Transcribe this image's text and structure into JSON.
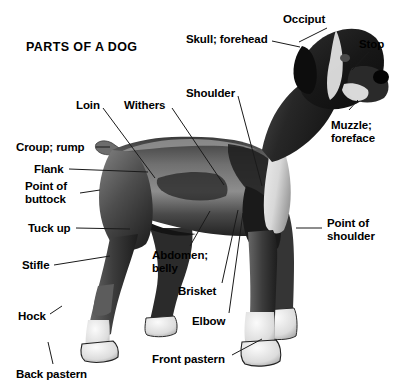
{
  "title": "PARTS OF A DOG",
  "subject": {
    "animal": "dog",
    "breed_appearance": "boxer",
    "orientation": "left profile, facing right",
    "rendering": "black and white photograph"
  },
  "colors": {
    "background": "#ffffff",
    "text": "#000000",
    "leader_line": "#1a1a1a",
    "coat_dark": "#1c1c1c",
    "coat_mid": "#6f6f6f",
    "coat_light": "#c9c9c9",
    "coat_white": "#f2f2f2"
  },
  "labels": [
    {
      "id": "occiput",
      "text": "Occiput",
      "lines": [
        "Occiput"
      ],
      "x": 283,
      "y": 13,
      "align": "left",
      "line": [
        327,
        28,
        299,
        42
      ]
    },
    {
      "id": "skull-forehead",
      "text": "Skull; forehead",
      "lines": [
        "Skull; forehead"
      ],
      "x": 186,
      "y": 33,
      "align": "left",
      "line": [
        272,
        41,
        300,
        47
      ]
    },
    {
      "id": "stop",
      "text": "Stop",
      "lines": [
        "Stop"
      ],
      "x": 359,
      "y": 38,
      "align": "left",
      "line": [
        369,
        52,
        352,
        70
      ]
    },
    {
      "id": "shoulder",
      "text": "Shoulder",
      "lines": [
        "Shoulder"
      ],
      "x": 186,
      "y": 87,
      "align": "left",
      "line": [
        238,
        96,
        262,
        186
      ]
    },
    {
      "id": "loin",
      "text": "Loin",
      "lines": [
        "Loin"
      ],
      "x": 76,
      "y": 99,
      "align": "left",
      "line": [
        103,
        108,
        155,
        178
      ]
    },
    {
      "id": "withers",
      "text": "Withers",
      "lines": [
        "Withers"
      ],
      "x": 124,
      "y": 99,
      "align": "left",
      "line": [
        172,
        108,
        224,
        185
      ]
    },
    {
      "id": "muzzle-foreface",
      "text": "Muzzle; foreface",
      "lines": [
        "Muzzle;",
        "foreface"
      ],
      "x": 331,
      "y": 119,
      "align": "left",
      "line": [
        349,
        110,
        358,
        100
      ]
    },
    {
      "id": "croup-rump",
      "text": "Croup; rump",
      "lines": [
        "Croup; rump"
      ],
      "x": 16,
      "y": 141,
      "align": "left",
      "line": [
        96,
        147,
        110,
        147
      ]
    },
    {
      "id": "flank",
      "text": "Flank",
      "lines": [
        "Flank"
      ],
      "x": 34,
      "y": 163,
      "align": "left",
      "line": [
        69,
        169,
        148,
        172
      ]
    },
    {
      "id": "point-of-buttock",
      "text": "Point of buttock",
      "lines": [
        "Point of",
        "buttock"
      ],
      "x": 25,
      "y": 180,
      "align": "left",
      "line": [
        80,
        193,
        100,
        190
      ]
    },
    {
      "id": "point-of-shoulder",
      "text": "Point of shoulder",
      "lines": [
        "Point of",
        "shoulder"
      ],
      "x": 327,
      "y": 217,
      "align": "left",
      "line": [
        322,
        228,
        296,
        228
      ]
    },
    {
      "id": "tuck-up",
      "text": "Tuck up",
      "lines": [
        "Tuck up"
      ],
      "x": 28,
      "y": 222,
      "align": "left",
      "line": [
        76,
        228,
        130,
        229
      ]
    },
    {
      "id": "abdomen-belly",
      "text": "Abdomen; belly",
      "lines": [
        "Abdomen;",
        "belly"
      ],
      "x": 152,
      "y": 249,
      "align": "left",
      "line": [
        190,
        246,
        210,
        211
      ]
    },
    {
      "id": "stifle",
      "text": "Stifle",
      "lines": [
        "Stifle"
      ],
      "x": 22,
      "y": 259,
      "align": "left",
      "line": [
        54,
        265,
        110,
        256
      ]
    },
    {
      "id": "brisket",
      "text": "Brisket",
      "lines": [
        "Brisket"
      ],
      "x": 178,
      "y": 285,
      "align": "left",
      "line": [
        222,
        283,
        238,
        210
      ]
    },
    {
      "id": "hock",
      "text": "Hock",
      "lines": [
        "Hock"
      ],
      "x": 18,
      "y": 310,
      "align": "left",
      "line": [
        50,
        314,
        62,
        306
      ]
    },
    {
      "id": "elbow",
      "text": "Elbow",
      "lines": [
        "Elbow"
      ],
      "x": 192,
      "y": 315,
      "align": "left",
      "line": [
        229,
        313,
        243,
        213
      ]
    },
    {
      "id": "front-pastern",
      "text": "Front pastern",
      "lines": [
        "Front pastern"
      ],
      "x": 152,
      "y": 353,
      "align": "left",
      "line": [
        232,
        355,
        262,
        339
      ]
    },
    {
      "id": "back-pastern",
      "text": "Back pastern",
      "lines": [
        "Back pastern"
      ],
      "x": 16,
      "y": 368,
      "align": "left",
      "line": [
        53,
        364,
        48,
        342
      ]
    }
  ]
}
